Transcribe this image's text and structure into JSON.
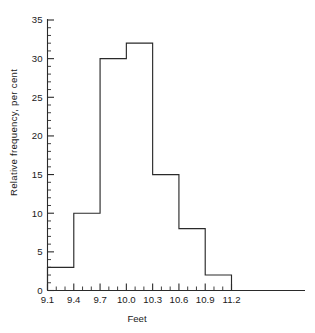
{
  "chart_data": {
    "type": "bar",
    "title": "",
    "xlabel": "Feet",
    "ylabel": "Relative frequency, per cent",
    "bin_edges": [
      9.1,
      9.4,
      9.7,
      10.0,
      10.3,
      10.6,
      10.9,
      11.2
    ],
    "categories": [
      "9.1-9.4",
      "9.4-9.7",
      "9.7-10.0",
      "10.0-10.3",
      "10.3-10.6",
      "10.6-10.9",
      "10.9-11.2"
    ],
    "values": [
      3,
      10,
      30,
      32,
      15,
      8,
      2
    ],
    "xlim": [
      9.1,
      11.2
    ],
    "ylim": [
      0,
      35
    ],
    "x_tick_labels": [
      "9.1",
      "9.4",
      "9.7",
      "10.0",
      "10.3",
      "10.6",
      "10.9",
      "11.2"
    ],
    "x_tick_values": [
      9.1,
      9.4,
      9.7,
      10.0,
      10.3,
      10.6,
      10.9,
      11.2
    ],
    "x_minor_step": 0.1,
    "y_tick_labels": [
      "0",
      "5",
      "10",
      "15",
      "20",
      "25",
      "30",
      "35"
    ],
    "y_tick_values": [
      0,
      5,
      10,
      15,
      20,
      25,
      30,
      35
    ],
    "y_minor_step": 1,
    "grid": false,
    "legend": null,
    "line_color": "#2a2a2a",
    "bar_fill": "none",
    "background": "#ffffff"
  },
  "axis": {
    "y_title": "Relative frequency, per cent",
    "x_title": "Feet"
  }
}
